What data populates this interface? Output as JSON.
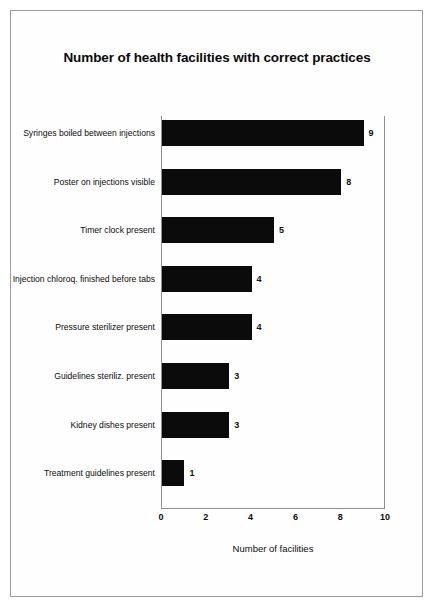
{
  "chart_data": {
    "type": "bar",
    "orientation": "horizontal",
    "title": "Number of health facilities with correct practices",
    "xlabel": "Number of facilities",
    "ylabel": "",
    "xlim": [
      0,
      10
    ],
    "xticks": [
      0,
      2,
      4,
      6,
      8,
      10
    ],
    "grid": false,
    "legend": null,
    "bar_color": "#0b0b0b",
    "categories": [
      "Syringes boiled between injections",
      "Poster on injections visible",
      "Timer clock present",
      "Injection chloroq. finished before tabs",
      "Pressure sterilizer present",
      "Guidelines steriliz. present",
      "Kidney dishes present",
      "Treatment guidelines present"
    ],
    "values": [
      9,
      8,
      5,
      4,
      4,
      3,
      3,
      1
    ],
    "value_labels": [
      "9",
      "8",
      "5",
      "4",
      "4",
      "3",
      "3",
      "1"
    ]
  }
}
